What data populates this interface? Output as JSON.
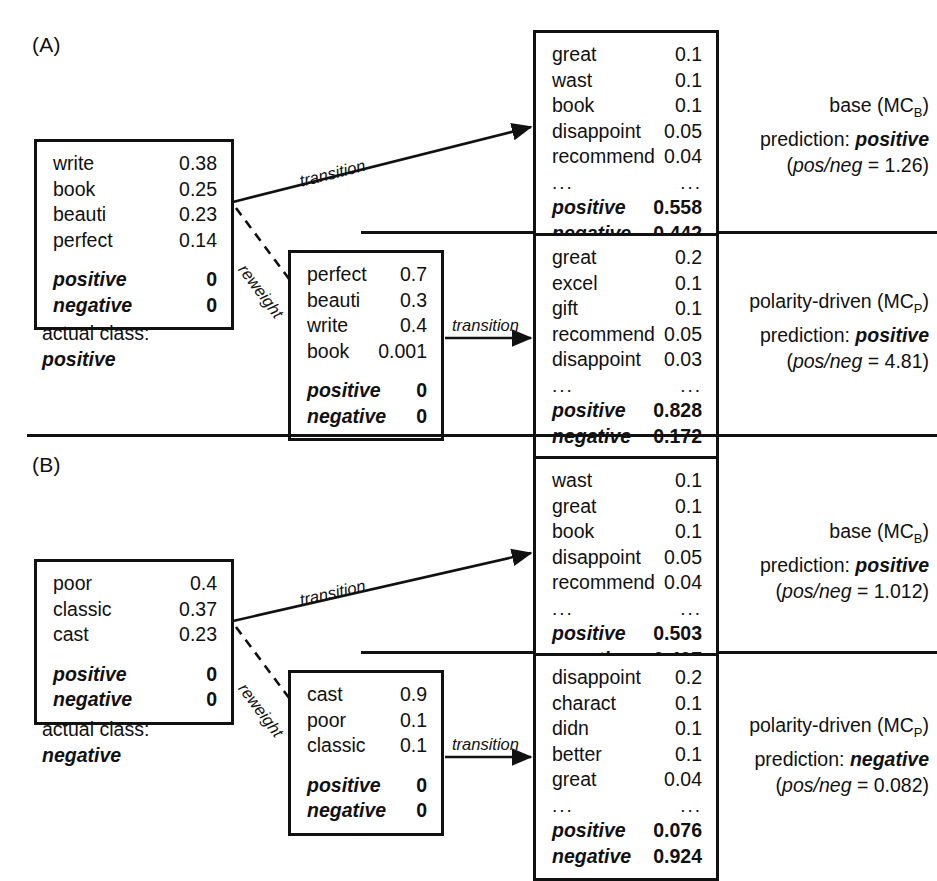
{
  "figure": {
    "panels": [
      {
        "id": "A",
        "label": "(A)",
        "actual_class_caption": "actual class:",
        "actual_class_value": "positive",
        "input_box": {
          "rows": [
            {
              "word": "write",
              "value": "0.38"
            },
            {
              "word": "book",
              "value": "0.25"
            },
            {
              "word": "beauti",
              "value": "0.23"
            },
            {
              "word": "perfect",
              "value": "0.14"
            }
          ],
          "class_rows": [
            {
              "word": "positive",
              "value": "0"
            },
            {
              "word": "negative",
              "value": "0"
            }
          ]
        },
        "reweight_box": {
          "rows": [
            {
              "word": "perfect",
              "value": "0.7"
            },
            {
              "word": "beauti",
              "value": "0.3"
            },
            {
              "word": "write",
              "value": "0.4"
            },
            {
              "word": "book",
              "value": "0.001"
            }
          ],
          "class_rows": [
            {
              "word": "positive",
              "value": "0"
            },
            {
              "word": "negative",
              "value": "0"
            }
          ]
        },
        "base_box": {
          "rows": [
            {
              "word": "great",
              "value": "0.1"
            },
            {
              "word": "wast",
              "value": "0.1"
            },
            {
              "word": "book",
              "value": "0.1"
            },
            {
              "word": "disappoint",
              "value": "0.05"
            },
            {
              "word": "recommend",
              "value": "0.04"
            }
          ],
          "ellipsis": {
            "word": "...",
            "value": "..."
          },
          "class_rows": [
            {
              "word": "positive",
              "value": "0.558"
            },
            {
              "word": "negative",
              "value": "0.442"
            }
          ]
        },
        "polarity_box": {
          "rows": [
            {
              "word": "great",
              "value": "0.2"
            },
            {
              "word": "excel",
              "value": "0.1"
            },
            {
              "word": "gift",
              "value": "0.1"
            },
            {
              "word": "recommend",
              "value": "0.05"
            },
            {
              "word": "disappoint",
              "value": "0.03"
            }
          ],
          "ellipsis": {
            "word": "...",
            "value": "..."
          },
          "class_rows": [
            {
              "word": "positive",
              "value": "0.828"
            },
            {
              "word": "negative",
              "value": "0.172"
            }
          ]
        },
        "base_annot": {
          "model_name": "base (MC",
          "model_sub": "B",
          "model_close": ")",
          "prediction_caption": "prediction: ",
          "prediction_value": "positive",
          "ratio_open": "(",
          "ratio_label": "pos/neg",
          "ratio_value": " = 1.26)"
        },
        "polarity_annot": {
          "model_name": "polarity-driven (MC",
          "model_sub": "P",
          "model_close": ")",
          "prediction_caption": "prediction: ",
          "prediction_value": "positive",
          "ratio_open": "(",
          "ratio_label": "pos/neg",
          "ratio_value": " = 4.81)"
        },
        "edges": {
          "transition_top": "transition",
          "reweight": "reweight",
          "transition_mid": "transition"
        }
      },
      {
        "id": "B",
        "label": "(B)",
        "actual_class_caption": "actual class:",
        "actual_class_value": "negative",
        "input_box": {
          "rows": [
            {
              "word": "poor",
              "value": "0.4"
            },
            {
              "word": "classic",
              "value": "0.37"
            },
            {
              "word": "cast",
              "value": "0.23"
            }
          ],
          "class_rows": [
            {
              "word": "positive",
              "value": "0"
            },
            {
              "word": "negative",
              "value": "0"
            }
          ]
        },
        "reweight_box": {
          "rows": [
            {
              "word": "cast",
              "value": "0.9"
            },
            {
              "word": "poor",
              "value": "0.1"
            },
            {
              "word": "classic",
              "value": "0.1"
            }
          ],
          "class_rows": [
            {
              "word": "positive",
              "value": "0"
            },
            {
              "word": "negative",
              "value": "0"
            }
          ]
        },
        "base_box": {
          "rows": [
            {
              "word": "wast",
              "value": "0.1"
            },
            {
              "word": "great",
              "value": "0.1"
            },
            {
              "word": "book",
              "value": "0.1"
            },
            {
              "word": "disappoint",
              "value": "0.05"
            },
            {
              "word": "recommend",
              "value": "0.04"
            }
          ],
          "ellipsis": {
            "word": "...",
            "value": "..."
          },
          "class_rows": [
            {
              "word": "positive",
              "value": "0.503"
            },
            {
              "word": "negative",
              "value": "0.497"
            }
          ]
        },
        "polarity_box": {
          "rows": [
            {
              "word": "disappoint",
              "value": "0.2"
            },
            {
              "word": "charact",
              "value": "0.1"
            },
            {
              "word": "didn",
              "value": "0.1"
            },
            {
              "word": "better",
              "value": "0.1"
            },
            {
              "word": "great",
              "value": "0.04"
            }
          ],
          "ellipsis": {
            "word": "...",
            "value": "..."
          },
          "class_rows": [
            {
              "word": "positive",
              "value": "0.076"
            },
            {
              "word": "negative",
              "value": "0.924"
            }
          ]
        },
        "base_annot": {
          "model_name": "base (MC",
          "model_sub": "B",
          "model_close": ")",
          "prediction_caption": "prediction: ",
          "prediction_value": "positive",
          "ratio_open": "(",
          "ratio_label": "pos/neg",
          "ratio_value": " = 1.012)"
        },
        "polarity_annot": {
          "model_name": "polarity-driven (MC",
          "model_sub": "P",
          "model_close": ")",
          "prediction_caption": "prediction: ",
          "prediction_value": "negative",
          "ratio_open": "(",
          "ratio_label": "pos/neg",
          "ratio_value": " = 0.082)"
        },
        "edges": {
          "transition_top": "transition",
          "reweight": "reweight",
          "transition_mid": "transition"
        }
      }
    ],
    "colors": {
      "ink": "#111111",
      "background": "#ffffff"
    }
  }
}
